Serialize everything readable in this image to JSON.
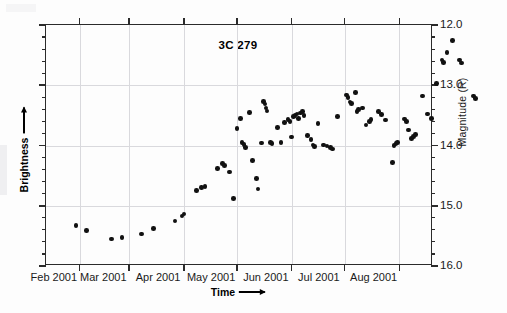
{
  "chart_data": {
    "type": "scatter",
    "title": "3C 279",
    "xlabel": "Time",
    "ylabel_left": "Brightness",
    "ylabel_right": "Magnitude (R)",
    "grid": true,
    "legend": "none",
    "x_is_date": true,
    "xlim": [
      "2001-01-13",
      "2001-08-20"
    ],
    "ylim": [
      16.0,
      12.0
    ],
    "y_inverted": true,
    "x_tick_labels": [
      "Feb 2001",
      "Mar 2001",
      "Apr 2001",
      "May 2001",
      "Jun 2001",
      "Jul 2001",
      "Aug 2001"
    ],
    "x_tick_positions_days": [
      18,
      46,
      77,
      107,
      138,
      168,
      199
    ],
    "y_tick_labels": [
      "12.0",
      "13.0",
      "14.0",
      "15.0",
      "16.0"
    ],
    "y_tick_values": [
      12.0,
      13.0,
      14.0,
      15.0,
      16.0
    ],
    "y_minor_step": 0.2,
    "marker": "filled-circle",
    "marker_color": "#111111",
    "points": [
      {
        "t": 30,
        "mag": 15.33
      },
      {
        "t": 36,
        "mag": 15.41
      },
      {
        "t": 50,
        "mag": 15.55
      },
      {
        "t": 56,
        "mag": 15.53
      },
      {
        "t": 67,
        "mag": 15.47
      },
      {
        "t": 74,
        "mag": 15.38
      },
      {
        "t": 86,
        "mag": 15.25
      },
      {
        "t": 90,
        "mag": 15.17
      },
      {
        "t": 91,
        "mag": 15.14
      },
      {
        "t": 98,
        "mag": 14.75
      },
      {
        "t": 101,
        "mag": 14.7
      },
      {
        "t": 103,
        "mag": 14.68
      },
      {
        "t": 110,
        "mag": 14.38
      },
      {
        "t": 113,
        "mag": 14.3
      },
      {
        "t": 114,
        "mag": 14.33
      },
      {
        "t": 117,
        "mag": 14.44
      },
      {
        "t": 119,
        "mag": 14.88
      },
      {
        "t": 121,
        "mag": 13.72
      },
      {
        "t": 123,
        "mag": 13.55
      },
      {
        "t": 124,
        "mag": 13.95
      },
      {
        "t": 125,
        "mag": 13.98
      },
      {
        "t": 126,
        "mag": 14.03
      },
      {
        "t": 128,
        "mag": 13.45
      },
      {
        "t": 130,
        "mag": 14.25
      },
      {
        "t": 132,
        "mag": 14.55
      },
      {
        "t": 133,
        "mag": 14.72
      },
      {
        "t": 135,
        "mag": 13.96
      },
      {
        "t": 136,
        "mag": 13.27
      },
      {
        "t": 137,
        "mag": 13.31
      },
      {
        "t": 137.5,
        "mag": 13.38
      },
      {
        "t": 138,
        "mag": 13.43
      },
      {
        "t": 140,
        "mag": 13.95
      },
      {
        "t": 141,
        "mag": 13.97
      },
      {
        "t": 144,
        "mag": 13.7
      },
      {
        "t": 146,
        "mag": 13.95
      },
      {
        "t": 148,
        "mag": 13.62
      },
      {
        "t": 150,
        "mag": 13.57
      },
      {
        "t": 151,
        "mag": 13.6
      },
      {
        "t": 152,
        "mag": 13.86
      },
      {
        "t": 153,
        "mag": 13.52
      },
      {
        "t": 154,
        "mag": 13.5
      },
      {
        "t": 155,
        "mag": 13.48
      },
      {
        "t": 156,
        "mag": 13.55
      },
      {
        "t": 157,
        "mag": 13.46
      },
      {
        "t": 158,
        "mag": 13.44
      },
      {
        "t": 159,
        "mag": 13.5
      },
      {
        "t": 161,
        "mag": 13.83
      },
      {
        "t": 163,
        "mag": 13.9
      },
      {
        "t": 164,
        "mag": 13.99
      },
      {
        "t": 165,
        "mag": 14.02
      },
      {
        "t": 167,
        "mag": 13.63
      },
      {
        "t": 170,
        "mag": 13.99
      },
      {
        "t": 172,
        "mag": 14.01
      },
      {
        "t": 174,
        "mag": 14.03
      },
      {
        "t": 175,
        "mag": 14.06
      },
      {
        "t": 178,
        "mag": 13.52
      },
      {
        "t": 183,
        "mag": 13.16
      },
      {
        "t": 184,
        "mag": 13.2
      },
      {
        "t": 185,
        "mag": 13.28
      },
      {
        "t": 186,
        "mag": 13.3
      },
      {
        "t": 188,
        "mag": 13.12
      },
      {
        "t": 189,
        "mag": 13.44
      },
      {
        "t": 190,
        "mag": 13.4
      },
      {
        "t": 192,
        "mag": 13.38
      },
      {
        "t": 194,
        "mag": 13.66
      },
      {
        "t": 196,
        "mag": 13.6
      },
      {
        "t": 197,
        "mag": 13.57
      },
      {
        "t": 201,
        "mag": 13.44
      },
      {
        "t": 203,
        "mag": 13.49
      },
      {
        "t": 205,
        "mag": 13.58
      },
      {
        "t": 210,
        "mag": 14.0
      },
      {
        "t": 211,
        "mag": 13.97
      },
      {
        "t": 212,
        "mag": 13.95
      },
      {
        "t": 209,
        "mag": 14.28
      },
      {
        "t": 216,
        "mag": 13.56
      },
      {
        "t": 217,
        "mag": 13.6
      },
      {
        "t": 218,
        "mag": 13.74
      },
      {
        "t": 220,
        "mag": 13.88
      },
      {
        "t": 221,
        "mag": 13.85
      },
      {
        "t": 222,
        "mag": 13.82
      },
      {
        "t": 226,
        "mag": 13.18
      },
      {
        "t": 229,
        "mag": 13.48
      },
      {
        "t": 231,
        "mag": 13.55
      },
      {
        "t": 234,
        "mag": 12.97
      },
      {
        "t": 237,
        "mag": 12.58
      },
      {
        "t": 238,
        "mag": 12.62
      },
      {
        "t": 240,
        "mag": 12.46
      },
      {
        "t": 243,
        "mag": 12.26
      },
      {
        "t": 247,
        "mag": 12.58
      },
      {
        "t": 248,
        "mag": 12.63
      },
      {
        "t": 255,
        "mag": 13.18
      },
      {
        "t": 256,
        "mag": 13.22
      }
    ]
  },
  "labels": {
    "title": "3C 279",
    "x_axis_label": "Time",
    "y_axis_label_left": "Brightness",
    "y_axis_label_right": "Magnitude (R)"
  }
}
